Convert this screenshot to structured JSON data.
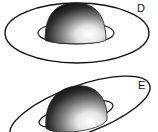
{
  "panels": [
    {
      "label": "D",
      "description": "hemisphere resting on flat ring, viewed from above"
    },
    {
      "label": "E",
      "description": "hemisphere on tilted ring"
    }
  ],
  "colors": {
    "stroke": "#111111",
    "shade_dark": "#1a1a1a",
    "shade_light": "#ffffff"
  }
}
